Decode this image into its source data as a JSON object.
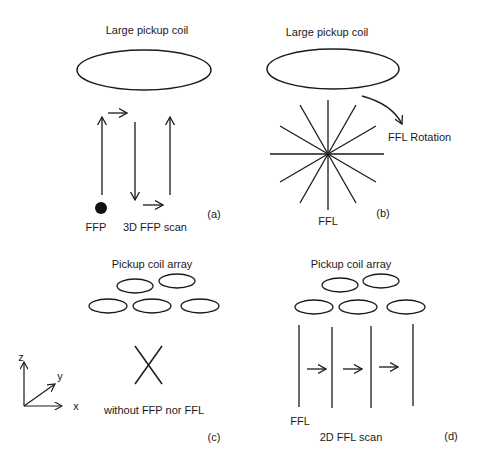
{
  "panels": {
    "a": {
      "title": "Large pickup coil",
      "point_label": "FFP",
      "scan_label": "3D FFP scan",
      "tag": "(a)"
    },
    "b": {
      "title": "Large pickup coil",
      "rotation_label": "FFL Rotation",
      "line_label": "FFL",
      "tag": "(b)"
    },
    "c": {
      "title": "Pickup coil array",
      "axes": {
        "x": "x",
        "y": "y",
        "z": "z"
      },
      "caption": "without FFP nor FFL",
      "tag": "(c)"
    },
    "d": {
      "title": "Pickup coil array",
      "line_label": "FFL",
      "scan_label": "2D FFL scan",
      "tag": "(d)"
    }
  },
  "colors": {
    "stroke": "#1a1a1a",
    "background": "#ffffff"
  }
}
